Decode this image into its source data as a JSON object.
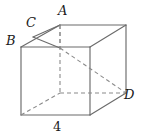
{
  "figure": {
    "type": "cube-oblique-projection",
    "title": "",
    "stroke_color": "#6b6b6b",
    "dashed_stroke_color": "#8a8a8a",
    "text_color": "#1a1a1a",
    "background_color": "#ffffff",
    "labels": {
      "a": "A",
      "b": "B",
      "c": "C",
      "d": "D",
      "edge_length": "4"
    },
    "label_positions": {
      "a": {
        "x": 58,
        "y": 4
      },
      "b": {
        "x": 6,
        "y": 34
      },
      "c": {
        "x": 26,
        "y": 16
      },
      "d": {
        "x": 124,
        "y": 88
      },
      "edge_length": {
        "x": 53,
        "y": 120
      }
    },
    "vertices": {
      "front_top_left": {
        "x": 21,
        "y": 47
      },
      "front_top_right": {
        "x": 90,
        "y": 47
      },
      "front_bottom_left": {
        "x": 21,
        "y": 115
      },
      "front_bottom_right": {
        "x": 90,
        "y": 115
      },
      "back_top_left": {
        "x": 60,
        "y": 25
      },
      "back_top_right": {
        "x": 126,
        "y": 25
      },
      "back_bottom_left": {
        "x": 60,
        "y": 93
      },
      "back_bottom_right": {
        "x": 126,
        "y": 93
      }
    },
    "solid_edges": [
      "front_top_left-front_top_right",
      "front_top_right-front_bottom_right",
      "front_bottom_right-front_bottom_left",
      "front_bottom_left-front_top_left",
      "front_top_left-back_top_left",
      "front_top_right-back_top_right",
      "front_bottom_right-back_bottom_right",
      "back_top_left-back_top_right",
      "back_top_right-back_bottom_right"
    ],
    "hidden_edges": [
      "back_top_left-back_bottom_left",
      "back_bottom_left-back_bottom_right",
      "back_bottom_left-front_bottom_left"
    ],
    "construction_lines": [
      {
        "from": "back_top_left",
        "to": "front_top_left",
        "style": "solid"
      },
      {
        "from": "back_top_left",
        "to": "front_top_right",
        "style": "solid"
      },
      {
        "from": "front_top_right",
        "to": "back_bottom_right",
        "style": "dashed"
      },
      {
        "from": "back_top_left",
        "to": "back_bottom_right",
        "style": "dashed"
      },
      {
        "from": "front_bottom_left",
        "to": "back_bottom_right",
        "style": "dashed"
      }
    ]
  }
}
